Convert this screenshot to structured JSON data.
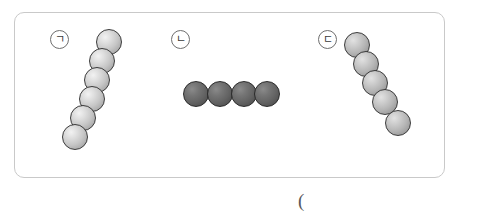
{
  "figure": {
    "title": "",
    "background_color": "#ffffff",
    "panel": {
      "border_color": "#c9c9c9",
      "x": 14,
      "y": 12,
      "width": 431,
      "height": 166,
      "corner_radius": 10
    },
    "caption": {
      "text": "(",
      "x": 298,
      "y": 191
    }
  },
  "groups": [
    {
      "label": "ㄱ",
      "label_x": 50,
      "label_y": 30,
      "sphere_style": "light",
      "sphere_color": "#c6c6c6",
      "count": 6,
      "arrangement": "diagonal-chain-up-right",
      "spheres": [
        {
          "x": 96,
          "y": 29,
          "d": 26
        },
        {
          "x": 89,
          "y": 48,
          "d": 26
        },
        {
          "x": 84,
          "y": 67,
          "d": 26
        },
        {
          "x": 79,
          "y": 86,
          "d": 26
        },
        {
          "x": 70,
          "y": 105,
          "d": 26
        },
        {
          "x": 62,
          "y": 124,
          "d": 26
        }
      ]
    },
    {
      "label": "ㄴ",
      "label_x": 171,
      "label_y": 30,
      "sphere_style": "dark",
      "sphere_color": "#636363",
      "count": 4,
      "arrangement": "horizontal-row",
      "spheres": [
        {
          "x": 183,
          "y": 81,
          "d": 26
        },
        {
          "x": 207,
          "y": 81,
          "d": 26
        },
        {
          "x": 231,
          "y": 81,
          "d": 26
        },
        {
          "x": 254,
          "y": 81,
          "d": 26
        }
      ]
    },
    {
      "label": "ㄷ",
      "label_x": 318,
      "label_y": 30,
      "sphere_style": "mid",
      "sphere_color": "#b5b5b5",
      "count": 5,
      "arrangement": "diagonal-chain-down-right",
      "spheres": [
        {
          "x": 344,
          "y": 32,
          "d": 26
        },
        {
          "x": 353,
          "y": 51,
          "d": 26
        },
        {
          "x": 362,
          "y": 70,
          "d": 26
        },
        {
          "x": 372,
          "y": 89,
          "d": 26
        },
        {
          "x": 385,
          "y": 110,
          "d": 26
        }
      ]
    }
  ]
}
